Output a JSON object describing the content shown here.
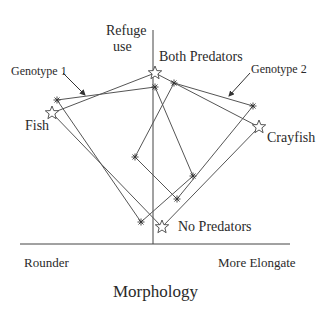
{
  "diagram": {
    "y_axis_label_line1": "Refuge",
    "y_axis_label_line2": "use",
    "x_axis_label": "Morphology",
    "x_left_label": "Rounder",
    "x_right_label": "More Elongate",
    "environment_labels": {
      "both": "Both Predators",
      "fish": "Fish",
      "crayfish": "Crayfish",
      "none": "No Predators"
    },
    "genotype_labels": {
      "g1": "Genotype 1",
      "g2": "Genotype 2"
    },
    "environment_means_star": [
      {
        "env": "Both Predators",
        "x": 155,
        "y": 73
      },
      {
        "env": "Crayfish",
        "x": 259,
        "y": 127
      },
      {
        "env": "No Predators",
        "x": 162,
        "y": 227
      },
      {
        "env": "Fish",
        "x": 52,
        "y": 113
      }
    ],
    "genotype_1_asterisk": [
      {
        "x": 57,
        "y": 100
      },
      {
        "x": 155,
        "y": 87
      },
      {
        "x": 193,
        "y": 176
      },
      {
        "x": 141,
        "y": 222
      }
    ],
    "genotype_2_asterisk": [
      {
        "x": 174,
        "y": 83
      },
      {
        "x": 253,
        "y": 106
      },
      {
        "x": 177,
        "y": 199
      },
      {
        "x": 135,
        "y": 157
      }
    ],
    "line_color": "#555555"
  }
}
